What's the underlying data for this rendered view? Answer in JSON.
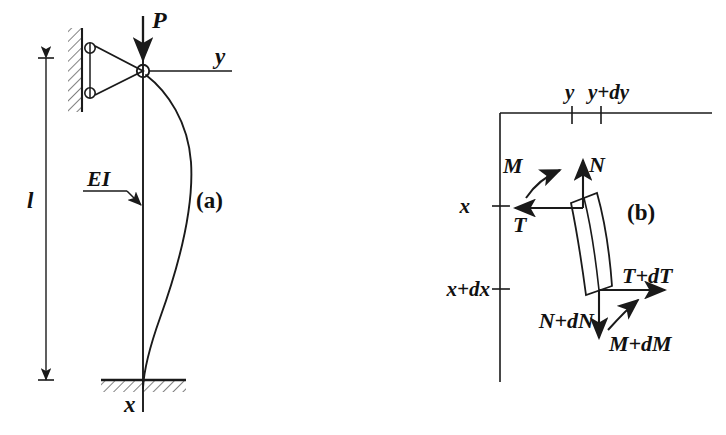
{
  "figure": {
    "background_color": "#ffffff",
    "ink_color": "#1a1a1a"
  },
  "panel_a": {
    "caption": "(a)",
    "labels": {
      "axial_load": "P",
      "transverse_axis": "y",
      "longitudinal_axis": "x",
      "flexural_rigidity": "EI",
      "length": "l"
    },
    "supports": {
      "top": "roller-pin-on-wall",
      "bottom": "fixed-hatched-base"
    },
    "curve": "buckled-deflection-curve"
  },
  "panel_b": {
    "caption": "(b)",
    "axis_labels": {
      "y": "y",
      "y_plus_dy": "y+dy",
      "x": "x",
      "x_plus_dx": "x+dx"
    },
    "forces_top": {
      "moment": "M",
      "normal": "N",
      "shear": "T"
    },
    "forces_bottom": {
      "shear": "T+dT",
      "normal": "N+dN",
      "moment": "M+dM"
    },
    "element": "differential-element"
  }
}
